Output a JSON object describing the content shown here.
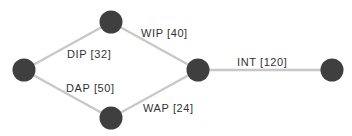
{
  "diagram": {
    "type": "network-graph",
    "colors": {
      "node": "#3f3f3f",
      "edge": "#c8c8c8",
      "label": "#333333",
      "background": "#ffffff"
    },
    "nodes": [
      {
        "id": "n0",
        "position": "left"
      },
      {
        "id": "n1",
        "position": "top"
      },
      {
        "id": "n2",
        "position": "bottom"
      },
      {
        "id": "n3",
        "position": "center-right"
      },
      {
        "id": "n4",
        "position": "far-right"
      }
    ],
    "edges": [
      {
        "from": "n0",
        "to": "n1",
        "name": "DIP",
        "weight": 32,
        "label": "DIP [32]"
      },
      {
        "from": "n0",
        "to": "n2",
        "name": "DAP",
        "weight": 50,
        "label": "DAP [50]"
      },
      {
        "from": "n1",
        "to": "n3",
        "name": "WIP",
        "weight": 40,
        "label": "WIP [40]"
      },
      {
        "from": "n2",
        "to": "n3",
        "name": "WAP",
        "weight": 24,
        "label": "WAP [24]"
      },
      {
        "from": "n3",
        "to": "n4",
        "name": "INT",
        "weight": 120,
        "label": "INT [120]"
      }
    ]
  }
}
